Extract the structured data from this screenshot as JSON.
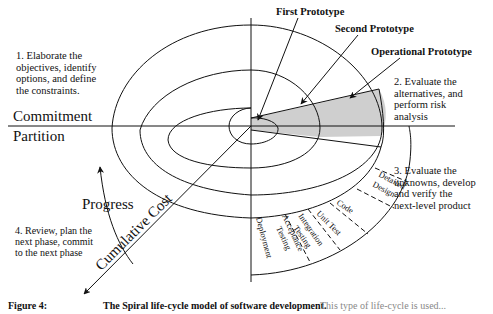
{
  "diagram": {
    "title": "Spiral life-cycle model",
    "quadrants": [
      {
        "id": 1,
        "lines": [
          "1. Elaborate the",
          "objectives, identify",
          "options, and define",
          "the constraints."
        ]
      },
      {
        "id": 2,
        "lines": [
          "2. Evaluate the",
          "alternatives, and",
          "perform risk",
          "analysis"
        ]
      },
      {
        "id": 3,
        "lines": [
          "3. Evaluate the",
          "unknowns, develop",
          "and verify the",
          "next-level product"
        ]
      },
      {
        "id": 4,
        "lines": [
          "4. Review, plan the",
          "next phase, commit",
          "to the next phase"
        ]
      }
    ],
    "prototypes": [
      "First Prototype",
      "Second Prototype",
      "Operational Prototype"
    ],
    "axis_labels": {
      "commitment": "Commitment",
      "partition": "Partition",
      "progress": "Progress",
      "cumulative_cost": "Cumulative Cost"
    },
    "lifecycle_steps": [
      "Detailed Design",
      "Code",
      "Unit Test",
      "Integration Testing",
      "Acceptance Testing",
      "Deployment"
    ],
    "colors": {
      "shade": "#cfcfcf",
      "line": "#111111"
    }
  },
  "caption": {
    "label": "Figure 4:",
    "title": "The Spiral life-cycle model of software development.",
    "rest": "This type of life-cycle is used..."
  }
}
